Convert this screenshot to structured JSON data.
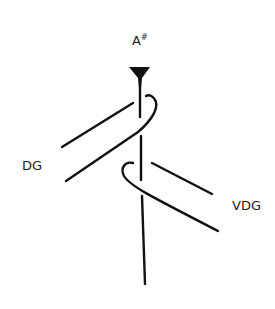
{
  "figure": {
    "labels": {
      "top": "A",
      "top_superscript": "#",
      "left": "DG",
      "right": "VDG"
    },
    "stroke_color": "#111111",
    "background": "#ffffff"
  }
}
